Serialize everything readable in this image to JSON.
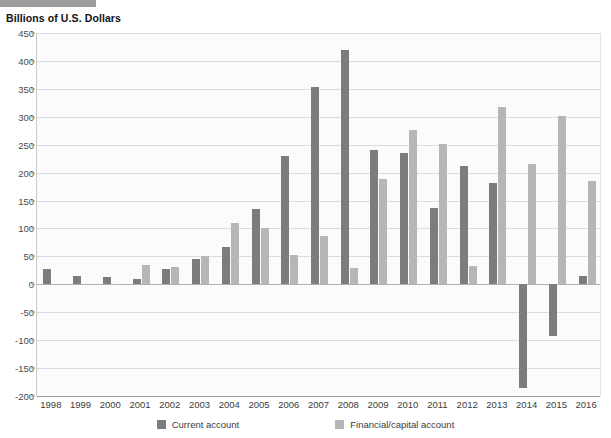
{
  "banner": {
    "name": "top-grey-rule"
  },
  "chart_data": {
    "type": "bar",
    "title": "",
    "ylabel": "Billions of U.S. Dollars",
    "xlabel": "",
    "ylim": [
      -200,
      450
    ],
    "yticks": [
      450,
      400,
      350,
      300,
      250,
      200,
      150,
      100,
      50,
      0,
      -50,
      -100,
      -150,
      -200
    ],
    "ytick_labels": [
      "450",
      "400",
      "350",
      "300",
      "250",
      "200",
      "150",
      "100",
      "50",
      "0",
      "-50",
      "-100",
      "-150",
      "-200"
    ],
    "grid": true,
    "legend_position": "bottom",
    "categories": [
      "1998",
      "1999",
      "2000",
      "2001",
      "2002",
      "2003",
      "2004",
      "2005",
      "2006",
      "2007",
      "2008",
      "2009",
      "2010",
      "2011",
      "2012",
      "2013",
      "2014",
      "2015",
      "2016"
    ],
    "series": [
      {
        "name": "Current account",
        "color": "#7c7c7c",
        "values": [
          28,
          14,
          13,
          9,
          27,
          45,
          66,
          134,
          230,
          353,
          420,
          241,
          236,
          136,
          212,
          181,
          -185,
          -93,
          15
        ]
      },
      {
        "name": "Financial/capital account",
        "color": "#b6b6b6",
        "values": [
          0,
          0,
          1,
          34,
          31,
          51,
          110,
          100,
          52,
          86,
          30,
          188,
          276,
          252,
          33,
          317,
          215,
          302,
          185
        ]
      }
    ]
  }
}
